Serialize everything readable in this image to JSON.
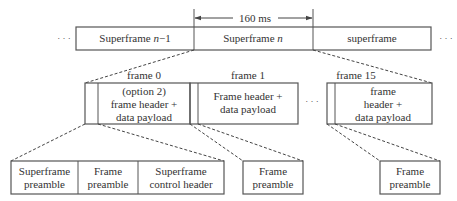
{
  "colors": {
    "line": "#555555",
    "text": "#333333",
    "background": "#ffffff"
  },
  "timing": {
    "label": "160 ms"
  },
  "superframes": {
    "ellipsis_left": "· · ·",
    "ellipsis_right": "· · ·",
    "items": [
      {
        "label_main": "Superframe ",
        "label_var": "n",
        "label_suffix": "−1"
      },
      {
        "label_main": "Superframe ",
        "label_var": "n",
        "label_suffix": ""
      },
      {
        "label_main": "superframe",
        "label_var": "",
        "label_suffix": ""
      }
    ]
  },
  "frames": {
    "ellipsis": "· · ·",
    "items": [
      {
        "title": "frame 0",
        "lines": [
          "(option 2)",
          "frame header +",
          "data payload"
        ]
      },
      {
        "title": "frame 1",
        "lines": [
          "Frame header +",
          "data payload"
        ]
      },
      {
        "title": "frame 15",
        "lines": [
          "frame",
          "header +",
          "data payload"
        ]
      }
    ]
  },
  "preambles": {
    "group0": [
      {
        "lines": [
          "Superframe",
          "preamble"
        ]
      },
      {
        "lines": [
          "Frame",
          "preamble"
        ]
      },
      {
        "lines": [
          "Superframe",
          "control header"
        ]
      }
    ],
    "group1": {
      "lines": [
        "Frame",
        "preamble"
      ]
    },
    "group15": {
      "lines": [
        "Frame",
        "preamble"
      ]
    }
  }
}
